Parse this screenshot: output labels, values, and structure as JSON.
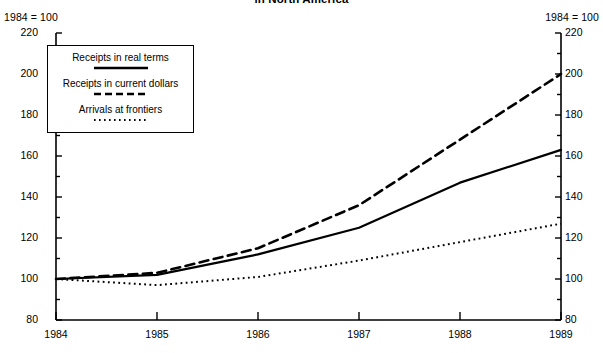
{
  "title": "in North America",
  "index_note_left": "1984 = 100",
  "index_note_right": "1984 = 100",
  "legend": {
    "entries": [
      {
        "label": "Receipts in real terms",
        "style": "solid"
      },
      {
        "label": "Receipts in current dollars",
        "style": "dashed"
      },
      {
        "label": "Arrivals at frontiers",
        "style": "dotted"
      }
    ]
  },
  "axes": {
    "y_ticks": [
      "220",
      "200",
      "180",
      "160",
      "140",
      "120",
      "100",
      "80"
    ],
    "x_ticks": [
      "1984",
      "1985",
      "1986",
      "1987",
      "1988",
      "1989"
    ]
  },
  "chart_data": {
    "type": "line",
    "title": "in North America",
    "subtitle": "1984 = 100",
    "xlabel": "",
    "ylabel": "1984 = 100",
    "x": [
      1984,
      1985,
      1986,
      1987,
      1988,
      1989
    ],
    "categories": [
      "1984",
      "1985",
      "1986",
      "1987",
      "1988",
      "1989"
    ],
    "xlim": [
      1984,
      1989
    ],
    "ylim": [
      80,
      220
    ],
    "y_major_step": 20,
    "y_minor_step": 10,
    "grid": false,
    "legend_position": "top-left",
    "series": [
      {
        "name": "Receipts in real terms",
        "style": "solid",
        "color": "#000000",
        "values": [
          100,
          102,
          112,
          125,
          147,
          163
        ]
      },
      {
        "name": "Receipts in current dollars",
        "style": "dashed",
        "color": "#000000",
        "values": [
          100,
          103,
          115,
          136,
          168,
          200
        ]
      },
      {
        "name": "Arrivals at frontiers",
        "style": "dotted",
        "color": "#000000",
        "values": [
          100,
          97,
          101,
          109,
          118,
          127
        ]
      }
    ]
  }
}
